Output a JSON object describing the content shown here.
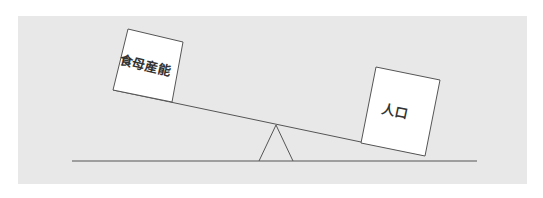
{
  "diagram": {
    "type": "seesaw-balance",
    "panel_color": "#e8e8e8",
    "line_color": "#555555",
    "left_box": {
      "label": "食母産能",
      "side": "left",
      "position": "raised"
    },
    "right_box": {
      "label": "人口",
      "side": "right",
      "position": "lowered"
    },
    "fulcrum": {
      "shape": "triangle"
    },
    "ground_line": true
  }
}
